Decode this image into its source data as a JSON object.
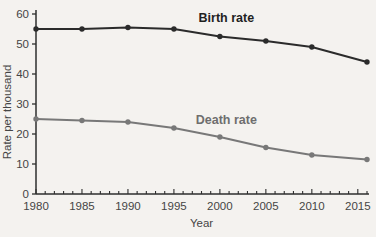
{
  "page": {
    "background": "#f4f2ef"
  },
  "chart_data": {
    "type": "line",
    "title": "",
    "xlabel": "Year",
    "ylabel": "Rate per thousand",
    "x": [
      1980,
      1985,
      1990,
      1995,
      2000,
      2005,
      2010,
      2016
    ],
    "series": [
      {
        "name": "Birth rate",
        "color": "#2b2b2b",
        "marker": "circle",
        "values": [
          55,
          55,
          55.5,
          55,
          52.5,
          51,
          49,
          44
        ]
      },
      {
        "name": "Death rate",
        "color": "#787878",
        "marker": "circle",
        "values": [
          25,
          24.5,
          24,
          22,
          19,
          15.5,
          13,
          11.5
        ]
      }
    ],
    "xlim": [
      1980,
      2016
    ],
    "ylim": [
      0,
      60
    ],
    "x_major_ticks": [
      1980,
      1985,
      1990,
      1995,
      2000,
      2005,
      2010,
      2015
    ],
    "x_minor_tick_interval": 1,
    "y_ticks": [
      0,
      10,
      20,
      30,
      40,
      50,
      60
    ],
    "grid": false,
    "legend": "inline-labels",
    "annotations": [
      {
        "text": "Birth rate",
        "x": 2000.7,
        "y": 57.2,
        "color": "#1f1f1f",
        "bold": true
      },
      {
        "text": "Death rate",
        "x": 2000.7,
        "y": 23.5,
        "color": "#6e6e6e",
        "bold": true
      }
    ],
    "axis_color": "#2e2e2e",
    "tick_label_color": "#454545"
  }
}
